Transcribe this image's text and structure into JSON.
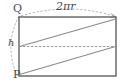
{
  "figure": {
    "type": "geometry-diagram",
    "canvas": {
      "width": 125,
      "height": 84
    },
    "colors": {
      "outline": "#555555",
      "helix": "#888888",
      "dashed": "#9a9a9a",
      "text": "#4a4a4a",
      "background": "#ffffff"
    },
    "rectangle": {
      "left": 19,
      "top": 17,
      "right": 116,
      "bottom": 76,
      "stroke_width": 1.2
    },
    "labels": {
      "top_vertex": "Q",
      "bottom_vertex": "P",
      "height": "h",
      "circumference": "2πr"
    },
    "lines": {
      "midline": {
        "name": "horizontal-midline",
        "style": "dashed",
        "y": 46.5,
        "x1": 19,
        "x2": 116
      },
      "helix_upper": {
        "name": "upper-helix-segment",
        "style": "solid",
        "x1": 19,
        "y1": 46.5,
        "x2": 116,
        "y2": 19
      },
      "helix_lower": {
        "name": "lower-helix-segment",
        "style": "solid",
        "x1": 19,
        "y1": 74,
        "x2": 116,
        "y2": 46.5
      }
    },
    "arcs": {
      "top_arc": {
        "name": "circumference-arc",
        "style": "dashed",
        "from": [
          21,
          16
        ],
        "control": [
          67,
          2
        ],
        "to": [
          115,
          16
        ],
        "arrowhead": true
      },
      "left_arc": {
        "name": "height-arc",
        "style": "dashed",
        "from": [
          19,
          16
        ],
        "control": [
          4,
          46
        ],
        "to": [
          17,
          76
        ],
        "arrowhead": false
      }
    }
  }
}
